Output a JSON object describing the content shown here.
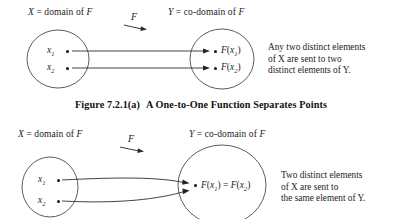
{
  "figure": {
    "caption_number": "Figure 7.2.1(a)",
    "caption_text": "A One-to-One Function Separates Points"
  },
  "diagram_top": {
    "domain_label": "X = domain of F",
    "domain_label_var": "X",
    "domain_label_rest": " = domain of ",
    "domain_label_fn": "F",
    "codomain_label_var": "Y",
    "codomain_label_rest": " = co-domain of ",
    "codomain_label_fn": "F",
    "map_label": "F",
    "domain_elements": [
      {
        "name": "x",
        "sub": "1"
      },
      {
        "name": "x",
        "sub": "2"
      }
    ],
    "codomain_elements": [
      {
        "prefix": "F",
        "open": "(",
        "name": "x",
        "sub": "1",
        "close": ")"
      },
      {
        "prefix": "F",
        "open": "(",
        "name": "x",
        "sub": "2",
        "close": ")"
      }
    ],
    "note_lines": [
      "Any two distinct elements",
      "of X are sent to two",
      "distinct elements of Y."
    ]
  },
  "diagram_bottom": {
    "domain_label_var": "X",
    "domain_label_rest": " = domain of ",
    "domain_label_fn": "F",
    "codomain_label_var": "Y",
    "codomain_label_rest": " = co-domain of ",
    "codomain_label_fn": "F",
    "map_label": "F",
    "domain_elements": [
      {
        "name": "x",
        "sub": "1"
      },
      {
        "name": "x",
        "sub": "2"
      }
    ],
    "image_element": {
      "left_fn": "F",
      "left_open": "(",
      "left_var": "x",
      "left_sub": "1",
      "left_close": ")",
      "equals": " = ",
      "right_fn": "F",
      "right_open": "(",
      "right_var": "x",
      "right_sub": "2",
      "right_close": ")"
    },
    "note_lines": [
      "Two distinct elements",
      "of X are sent to",
      "the same element of Y."
    ]
  },
  "colors": {
    "ink": "#1d1d1d",
    "stroke": "#3a3a3a",
    "background": "#ffffff"
  }
}
